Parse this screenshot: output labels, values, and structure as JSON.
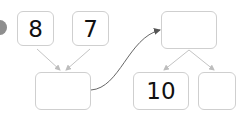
{
  "diagram": {
    "nodes": [
      {
        "id": "a",
        "label": "8"
      },
      {
        "id": "b",
        "label": "7"
      },
      {
        "id": "c",
        "label": ""
      },
      {
        "id": "d",
        "label": ""
      },
      {
        "id": "e",
        "label": "10"
      },
      {
        "id": "f",
        "label": ""
      }
    ],
    "edges": [
      {
        "from": "a",
        "to": "c"
      },
      {
        "from": "b",
        "to": "c"
      },
      {
        "from": "c",
        "to": "d",
        "style": "curved"
      },
      {
        "from": "d",
        "to": "e"
      },
      {
        "from": "d",
        "to": "f"
      }
    ],
    "colors": {
      "border": "#cfcfcf",
      "arrow": "#bdbdbd",
      "curve": "#666666",
      "marker": "#8e8e8e"
    }
  }
}
